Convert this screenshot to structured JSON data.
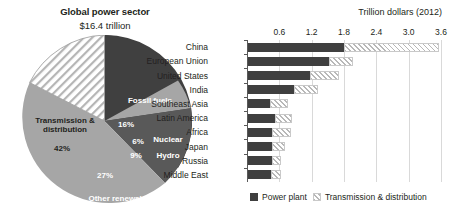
{
  "pie": {
    "title": "Global power sector",
    "subtitle": "$16.4 trillion",
    "slices": [
      {
        "label": "Fossil fuels",
        "pct_label": "16%",
        "value": 16,
        "color": "#404040"
      },
      {
        "label": "Nuclear",
        "pct_label": "6%",
        "value": 6,
        "color": "#a6a6a6"
      },
      {
        "label": "Hydro",
        "pct_label": "9%",
        "value": 9,
        "color": "#595959"
      },
      {
        "label": "Other renewables",
        "pct_label": "27%",
        "value": 27,
        "color": "#a6a6a6"
      },
      {
        "label": "Transmission & distribution",
        "pct_label": "42%",
        "value": 42,
        "color": "#hatched"
      }
    ]
  },
  "bars": {
    "axis_title": "Trillion dollars (2012)",
    "ticks": [
      "0.6",
      "1.2",
      "1.8",
      "2.4",
      "3.0",
      "3.6"
    ],
    "legend": [
      {
        "label": "Power plant",
        "swatch": "power-plant-swatch"
      },
      {
        "label": "Transmission & distribution",
        "swatch": "transmission-distribution-swatch"
      }
    ],
    "categories": [
      "China",
      "European Union",
      "United States",
      "India",
      "Southeast Asia",
      "Latin America",
      "Africa",
      "Japan",
      "Russia",
      "Middle East"
    ]
  },
  "chart_data": [
    {
      "type": "pie",
      "title": "Global power sector",
      "subtitle": "$16.4 trillion",
      "total_label": "$16.4 trillion",
      "unit": "percent of total investment",
      "categories": [
        "Fossil fuels",
        "Nuclear",
        "Hydro",
        "Other renewables",
        "Transmission & distribution"
      ],
      "values": [
        16,
        6,
        9,
        27,
        42
      ],
      "labels": [
        "16%",
        "6%",
        "9%",
        "27%",
        "42%"
      ],
      "legend": "inline labels on slices"
    },
    {
      "type": "bar",
      "orientation": "horizontal",
      "stacked": true,
      "title": "",
      "xlabel": "Trillion dollars (2012)",
      "ylabel": "",
      "xlim": [
        0,
        3.6
      ],
      "xticks": [
        0.6,
        1.2,
        1.8,
        2.4,
        3.0,
        3.6
      ],
      "grid": "vertical",
      "legend_position": "bottom",
      "categories": [
        "China",
        "European Union",
        "United States",
        "India",
        "Southeast Asia",
        "Latin America",
        "Africa",
        "Japan",
        "Russia",
        "Middle East"
      ],
      "series": [
        {
          "name": "Power plant",
          "values": [
            1.78,
            1.5,
            1.15,
            0.85,
            0.4,
            0.5,
            0.45,
            0.45,
            0.45,
            0.43
          ]
        },
        {
          "name": "Transmission & distribution",
          "values": [
            1.76,
            0.45,
            0.53,
            0.45,
            0.35,
            0.32,
            0.35,
            0.23,
            0.17,
            0.18
          ]
        }
      ],
      "totals": [
        3.54,
        1.95,
        1.68,
        1.3,
        0.75,
        0.82,
        0.8,
        0.68,
        0.62,
        0.61
      ]
    }
  ]
}
